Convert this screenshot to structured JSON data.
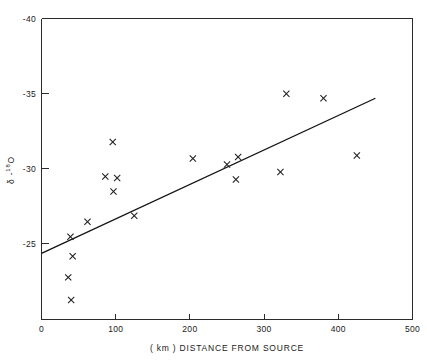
{
  "chart_data": {
    "type": "scatter",
    "title": "",
    "xlabel": "( km ) DISTANCE FROM SOURCE",
    "ylabel": "δ - ¹⁸O",
    "ylabel_parts": {
      "delta": "δ -",
      "sup": "18",
      "element": "O"
    },
    "xlim": [
      0,
      500
    ],
    "ylim": [
      -20,
      -40
    ],
    "y_axis_inverted": true,
    "xticks": [
      0,
      100,
      200,
      300,
      400,
      500
    ],
    "xticklabels": [
      "0",
      "100",
      "200",
      "300",
      "400",
      "500"
    ],
    "yticks": [
      -40,
      -35,
      -30,
      -25
    ],
    "yticklabels": [
      "-40",
      "-35",
      "-30",
      "-25"
    ],
    "grid": false,
    "legend": null,
    "marker": "x",
    "series": [
      {
        "name": "samples",
        "points": [
          {
            "x": 39,
            "y": -25.5
          },
          {
            "x": 42,
            "y": -24.2
          },
          {
            "x": 36,
            "y": -22.8
          },
          {
            "x": 40,
            "y": -21.3
          },
          {
            "x": 62,
            "y": -26.5
          },
          {
            "x": 96,
            "y": -31.8
          },
          {
            "x": 86,
            "y": -29.5
          },
          {
            "x": 102,
            "y": -29.4
          },
          {
            "x": 97,
            "y": -28.5
          },
          {
            "x": 125,
            "y": -26.9
          },
          {
            "x": 204,
            "y": -30.7
          },
          {
            "x": 250,
            "y": -30.3
          },
          {
            "x": 262,
            "y": -29.3
          },
          {
            "x": 265,
            "y": -30.8
          },
          {
            "x": 330,
            "y": -35.0
          },
          {
            "x": 322,
            "y": -29.8
          },
          {
            "x": 380,
            "y": -34.7
          },
          {
            "x": 425,
            "y": -30.9
          }
        ]
      }
    ],
    "trendline": {
      "name": "linear fit",
      "x_start": 0,
      "y_start": -24.4,
      "x_end": 450,
      "y_end": -34.7
    }
  }
}
